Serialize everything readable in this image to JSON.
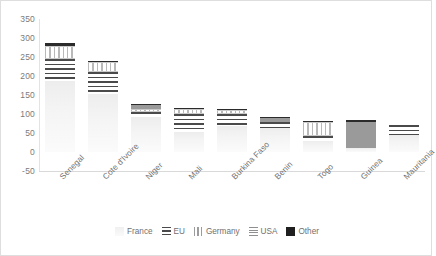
{
  "chart_data": {
    "type": "bar",
    "stacked": true,
    "title": "",
    "subtitle": "",
    "xlabel": "",
    "ylabel": "",
    "ylim": [
      -50,
      350
    ],
    "yticks": [
      350,
      300,
      250,
      200,
      150,
      100,
      50,
      0,
      -50
    ],
    "grid": false,
    "legend_position": "bottom",
    "categories": [
      "Senegal",
      "Cote d'Ivoire",
      "Niger",
      "Mali",
      "Burkina Faso",
      "Benin",
      "Togo",
      "Guinea",
      "Mauritania"
    ],
    "series": [
      {
        "name": "France",
        "key": "france",
        "values": [
          188,
          152,
          92,
          52,
          69,
          62,
          30,
          10,
          46
        ]
      },
      {
        "name": "EU",
        "key": "eu",
        "values": [
          57,
          59,
          13,
          48,
          31,
          16,
          12,
          0,
          24
        ]
      },
      {
        "name": "Germany",
        "key": "germany",
        "values": [
          33,
          25,
          9,
          14,
          11,
          0,
          38,
          0,
          0
        ]
      },
      {
        "name": "USA",
        "key": "usa",
        "values": [
          0,
          0,
          10,
          0,
          0,
          12,
          0,
          70,
          0
        ]
      },
      {
        "name": "Other",
        "key": "other",
        "values": [
          9,
          4,
          3,
          3,
          1,
          2,
          2,
          4,
          2
        ]
      }
    ],
    "totals": [
      287,
      240,
      127,
      117,
      112,
      92,
      82,
      84,
      72
    ],
    "colors": {
      "france": "#f2f2f2",
      "eu": "#4a4a4a",
      "germany": "#b9b9b9",
      "usa": "#9a9a9a",
      "other": "#2b2b2b",
      "axis_text": "#6f6f6f",
      "axis_line": "#d9d9d9",
      "frame": "#dedede"
    }
  }
}
